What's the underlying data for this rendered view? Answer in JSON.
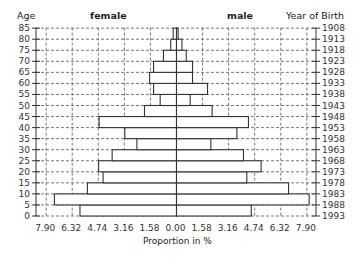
{
  "chart_data": {
    "type": "bar",
    "subtype": "population-pyramid",
    "title": "",
    "xlabel": "Proportion in %",
    "ylabel_left": "Age",
    "ylabel_right": "Year of Birth",
    "legend": {
      "left": "female",
      "right": "male"
    },
    "x_ticks": [
      "7.90",
      "6.32",
      "4.74",
      "3.16",
      "1.58",
      "0.00",
      "1.58",
      "3.16",
      "4.74",
      "6.32",
      "7.90"
    ],
    "x_tick_values": [
      -7.9,
      -6.32,
      -4.74,
      -3.16,
      -1.58,
      0.0,
      1.58,
      3.16,
      4.74,
      6.32,
      7.9
    ],
    "xlim": [
      -7.9,
      7.9
    ],
    "y_ticks_age": [
      "0",
      "5",
      "10",
      "15",
      "20",
      "25",
      "30",
      "35",
      "40",
      "45",
      "50",
      "55",
      "60",
      "65",
      "70",
      "75",
      "80",
      "85"
    ],
    "y_ticks_birth_year": [
      "1993",
      "1988",
      "1983",
      "1978",
      "1973",
      "1968",
      "1963",
      "1958",
      "1953",
      "1948",
      "1943",
      "1938",
      "1933",
      "1928",
      "1923",
      "1918",
      "1913",
      "1908"
    ],
    "ylim": [
      0,
      85
    ],
    "grid": true,
    "categories": [
      "0-5",
      "5-10",
      "10-15",
      "15-20",
      "20-25",
      "25-30",
      "30-35",
      "35-40",
      "40-45",
      "45-50",
      "50-55",
      "55-60",
      "60-65",
      "65-70",
      "70-75",
      "75-80",
      "80-85"
    ],
    "series": [
      {
        "name": "female",
        "side": "left",
        "values": [
          5.85,
          7.4,
          5.4,
          4.45,
          4.72,
          3.9,
          2.4,
          3.13,
          4.69,
          1.94,
          0.99,
          1.39,
          1.63,
          1.39,
          0.79,
          0.35,
          0.2
        ]
      },
      {
        "name": "male",
        "side": "right",
        "values": [
          4.53,
          8.04,
          6.79,
          4.26,
          5.13,
          4.06,
          2.08,
          3.66,
          4.36,
          2.16,
          0.83,
          1.88,
          0.97,
          0.97,
          0.59,
          0.33,
          0.1
        ]
      }
    ]
  },
  "header": {
    "age_label": "Age",
    "female_label": "female",
    "male_label": "male",
    "birth_label": "Year of Birth"
  },
  "axis": {
    "xlabel": "Proportion in %"
  },
  "colors": {
    "bar_fill": "#ffffff",
    "bar_stroke": "#333333",
    "grid": "#555555",
    "text": "#333333"
  }
}
